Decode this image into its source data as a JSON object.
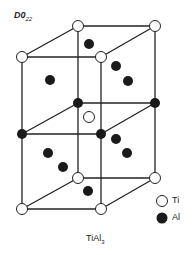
{
  "title": {
    "main": "D0",
    "sub": "22"
  },
  "caption": {
    "main": "TiAl",
    "sub": "3"
  },
  "legend": [
    {
      "label": "Ti",
      "symbol": "open-circle"
    },
    {
      "label": "Al",
      "symbol": "filled-circle"
    }
  ],
  "colors": {
    "line": "#222222",
    "ti_fill": "#ffffff",
    "al_fill": "#1a1a1a"
  },
  "structure": {
    "type": "D0_22 tetragonal unit cell (two stacked cubes)",
    "ti_atoms": [
      [
        22,
        57
      ],
      [
        78,
        26
      ],
      [
        155,
        26
      ],
      [
        101,
        57
      ],
      [
        89,
        117
      ],
      [
        22,
        209
      ],
      [
        101,
        209
      ],
      [
        78,
        178
      ],
      [
        155,
        178
      ]
    ],
    "al_atoms": [
      [
        89,
        44
      ],
      [
        116,
        66
      ],
      [
        128,
        81
      ],
      [
        50,
        80
      ],
      [
        22,
        134
      ],
      [
        101,
        134
      ],
      [
        78,
        103
      ],
      [
        155,
        103
      ],
      [
        48,
        153
      ],
      [
        63,
        167
      ],
      [
        116,
        139
      ],
      [
        127,
        153
      ],
      [
        88,
        191
      ]
    ]
  }
}
